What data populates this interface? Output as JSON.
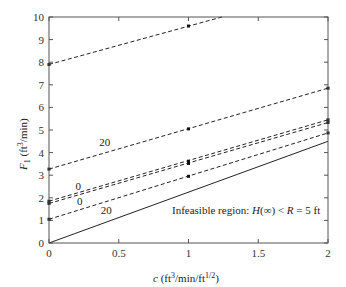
{
  "chart_data": {
    "type": "line",
    "title": "",
    "xlabel": "c (ft³/min/ft¹ᐟ²)",
    "xlabel_parts": {
      "var": "c",
      "unit": " (ft",
      "sup1": "3",
      "mid": "/min/ft",
      "sup2": "1/2",
      "end": ")"
    },
    "ylabel": "F₁ (ft³/min)",
    "ylabel_parts": {
      "var": "F",
      "sub": "1",
      "unit": " (ft",
      "sup": "3",
      "end": "/min)"
    },
    "xlim": [
      0,
      2
    ],
    "ylim": [
      0,
      10
    ],
    "xticks": [
      0,
      0.5,
      1,
      1.5,
      2
    ],
    "xtick_labels": [
      "0",
      "0.5",
      "1",
      "1.5",
      "2"
    ],
    "yticks": [
      0,
      1,
      2,
      3,
      4,
      5,
      6,
      7,
      8,
      9,
      10
    ],
    "ytick_labels": [
      "0",
      "1",
      "2",
      "3",
      "4",
      "5",
      "6",
      "7",
      "8",
      "9",
      "10"
    ],
    "grid": false,
    "legend": "none (curves labeled inline)",
    "series": [
      {
        "name": "60",
        "style": "dashed",
        "x": [
          0,
          1.24
        ],
        "y": [
          7.9,
          10.0
        ],
        "markers": [
          {
            "x": 0,
            "y": 7.9
          },
          {
            "x": 1,
            "y": 9.6
          }
        ],
        "label_pos": {
          "x": 0.35,
          "y": 8.8
        }
      },
      {
        "name": "20 (upper)",
        "label": "20",
        "style": "dashed",
        "x": [
          0,
          2
        ],
        "y": [
          3.27,
          6.85
        ],
        "markers": [
          {
            "x": 0,
            "y": 3.27
          },
          {
            "x": 1,
            "y": 5.05
          },
          {
            "x": 2,
            "y": 6.85
          }
        ],
        "label_pos": {
          "x": 0.4,
          "y": 4.3
        }
      },
      {
        "name": "0 (a)",
        "label": "0",
        "style": "dashed",
        "x": [
          0,
          2
        ],
        "y": [
          1.85,
          5.45
        ],
        "markers": [
          {
            "x": 0,
            "y": 1.85
          },
          {
            "x": 1,
            "y": 3.62
          },
          {
            "x": 2,
            "y": 5.45
          }
        ],
        "label_pos": {
          "x": 0.21,
          "y": 2.35
        }
      },
      {
        "name": "0 (b)",
        "label": "0",
        "style": "dashed",
        "x": [
          0,
          2
        ],
        "y": [
          1.75,
          5.33
        ],
        "markers": [
          {
            "x": 0,
            "y": 1.75
          },
          {
            "x": 1,
            "y": 3.52
          },
          {
            "x": 2,
            "y": 5.33
          }
        ],
        "label_pos": {
          "x": 0.22,
          "y": 1.7
        }
      },
      {
        "name": "0 (c)",
        "label": "",
        "style": "dashed",
        "x": [
          0,
          2
        ],
        "y": [
          1.05,
          4.87
        ],
        "markers": [
          {
            "x": 0,
            "y": 1.05
          },
          {
            "x": 1,
            "y": 2.95
          },
          {
            "x": 2,
            "y": 4.87
          }
        ],
        "label_pos": null
      },
      {
        "name": "20 (lower, boundary)",
        "label": "20",
        "style": "solid",
        "x": [
          0,
          2
        ],
        "y": [
          0,
          4.5
        ],
        "markers": [],
        "label_pos": {
          "x": 0.41,
          "y": 1.3
        }
      }
    ],
    "annotations": [
      {
        "text": "Infeasible region: H(∞) < R = 5 ft",
        "parts": {
          "a": "Infeasible region: ",
          "H": "H",
          "b": "(∞) < ",
          "R": "R",
          "c": " = 5 ft"
        },
        "x": 0.88,
        "y": 1.45
      }
    ]
  }
}
